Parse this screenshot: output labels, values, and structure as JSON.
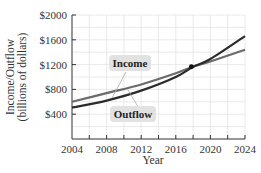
{
  "chart_data": {
    "type": "line",
    "title": "",
    "xlabel": "Year",
    "ylabel": "Income/Outflow (billions of dollars)",
    "ylabel_lines": [
      "Income/Outflow",
      "(billions of dollars)"
    ],
    "x_ticks": [
      2004,
      2008,
      2012,
      2016,
      2020,
      2024
    ],
    "x_tick_labels": [
      "2004",
      "2008",
      "2012",
      "2016",
      "2020",
      "2024"
    ],
    "y_ticks": [
      400,
      800,
      1200,
      1600,
      2000
    ],
    "y_tick_labels": [
      "$400",
      "$800",
      "$1200",
      "$1600",
      "$2000"
    ],
    "xlim": [
      2004,
      2024
    ],
    "ylim": [
      0,
      2000
    ],
    "grid": true,
    "x": [
      2004,
      2008,
      2012,
      2016,
      2018,
      2020,
      2024
    ],
    "series": [
      {
        "name": "Income",
        "values": [
          600,
          740,
          880,
          1060,
          1165,
          1250,
          1440
        ],
        "color": "#666666"
      },
      {
        "name": "Outflow",
        "values": [
          505,
          620,
          780,
          1000,
          1165,
          1290,
          1660
        ],
        "color": "#333333"
      }
    ],
    "annotations": [
      {
        "type": "intersection-point",
        "x": 2017.8,
        "y": 1165
      },
      {
        "type": "label",
        "text": "Income",
        "series": "Income"
      },
      {
        "type": "label",
        "text": "Outflow",
        "series": "Outflow"
      }
    ]
  },
  "labels": {
    "income": "Income",
    "outflow": "Outflow",
    "x_title": "Year",
    "y_title_1": "Income/Outflow",
    "y_title_2": "(billions of dollars)"
  },
  "colors": {
    "grid": "#e4e4e4",
    "axis": "#333333",
    "income_line": "#6b6b6b",
    "outflow_line": "#2b2b2b",
    "label_box": "#e2e2e2"
  }
}
